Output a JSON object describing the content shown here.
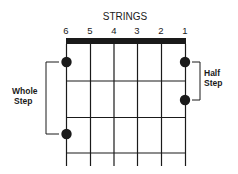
{
  "title": "STRINGS",
  "strings": [
    "6",
    "5",
    "4",
    "3",
    "2",
    "1"
  ],
  "labels": {
    "whole_line1": "Whole",
    "whole_line2": "Step",
    "half_line1": "Half",
    "half_line2": "Step"
  },
  "colors": {
    "ink": "#1a1a1a",
    "background": "#ffffff"
  }
}
